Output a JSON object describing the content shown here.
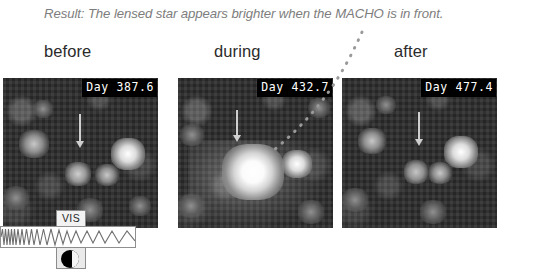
{
  "caption": {
    "text": "Result: The lensed star appears brighter when the MACHO is in front."
  },
  "phases": [
    {
      "id": "before",
      "label": "before",
      "day_stamp": "Day 387.6"
    },
    {
      "id": "during",
      "label": "during",
      "day_stamp": "Day 432.7"
    },
    {
      "id": "after",
      "label": "after",
      "day_stamp": "Day 477.4"
    }
  ],
  "panels": {
    "before": {
      "day_stamp": "Day 387.6"
    },
    "during": {
      "day_stamp": "Day 432.7"
    },
    "after": {
      "day_stamp": "Day 477.4"
    }
  },
  "spectrum": {
    "band_label": "VIS"
  },
  "colors": {
    "caption_text": "#7d7d7d",
    "label_text": "#2b2b2b",
    "stamp_background": "#000000",
    "stamp_text": "#ffffff",
    "leader_line": "#9a9a9a",
    "page_background": "#ffffff"
  }
}
